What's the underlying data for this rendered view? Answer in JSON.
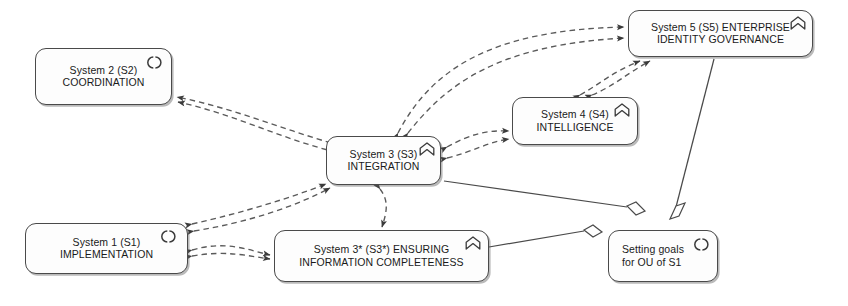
{
  "diagram": {
    "background_color": "#ffffff",
    "line_color": "#4a4a4a",
    "node_fill": "#fdfdfd"
  },
  "nodes": [
    {
      "id": "s2",
      "name": "system-2",
      "line1": "System 2 (S2)",
      "line2": "COORDINATION",
      "icon": "interaction-icon",
      "x": 35,
      "y": 48,
      "w": 137,
      "h": 57,
      "align": "center"
    },
    {
      "id": "s5",
      "name": "system-5",
      "line1": "System 5 (S5) ENTERPRISE",
      "line2": "IDENTITY GOVERNANCE",
      "icon": "function-icon",
      "x": 628,
      "y": 10,
      "w": 185,
      "h": 47,
      "align": "center"
    },
    {
      "id": "s4",
      "name": "system-4",
      "line1": "System 4 (S4)",
      "line2": "INTELLIGENCE",
      "icon": "function-icon",
      "x": 512,
      "y": 97,
      "w": 126,
      "h": 48,
      "align": "center"
    },
    {
      "id": "s3",
      "name": "system-3",
      "line1": "System 3 (S3)",
      "line2": "INTEGRATION",
      "icon": "function-icon",
      "x": 326,
      "y": 136,
      "w": 115,
      "h": 49,
      "align": "center"
    },
    {
      "id": "s1",
      "name": "system-1",
      "line1": "System 1 (S1)",
      "line2": "IMPLEMENTATION",
      "icon": "interaction-icon",
      "x": 25,
      "y": 223,
      "w": 163,
      "h": 51,
      "align": "center"
    },
    {
      "id": "s3star",
      "name": "system-3-star",
      "line1": "System 3* (S3*) ENSURING",
      "line2": "INFORMATION COMPLETENESS",
      "icon": "function-icon",
      "x": 274,
      "y": 230,
      "w": 215,
      "h": 52,
      "align": "center"
    },
    {
      "id": "goals",
      "name": "setting-goals",
      "line1": "Setting goals",
      "line2": "for OU of S1",
      "icon": "interaction-icon",
      "x": 608,
      "y": 230,
      "w": 110,
      "h": 52,
      "align": "left"
    }
  ],
  "connections": [
    {
      "name": "s3-to-s2-flow",
      "style": "dashed",
      "arrow": "both"
    },
    {
      "name": "s2-to-s3-flow",
      "style": "dashed",
      "arrow": "both"
    },
    {
      "name": "s3-to-s5-flow",
      "style": "dashed",
      "arrow": "both"
    },
    {
      "name": "s4-to-s5-flow",
      "style": "dashed",
      "arrow": "both"
    },
    {
      "name": "s3-to-s4-flow",
      "style": "dashed",
      "arrow": "both"
    },
    {
      "name": "s1-to-s3-flow",
      "style": "dashed",
      "arrow": "both"
    },
    {
      "name": "s1-to-s3star-flow",
      "style": "dashed",
      "arrow": "both"
    },
    {
      "name": "s3-to-s3star-flow",
      "style": "dashed",
      "arrow": "both"
    },
    {
      "name": "s3-to-goals-aggregation",
      "style": "solid",
      "marker": "diamond"
    },
    {
      "name": "s5-to-goals-aggregation",
      "style": "solid",
      "marker": "diamond"
    },
    {
      "name": "s3star-to-goals-aggregation",
      "style": "solid",
      "marker": "diamond"
    }
  ]
}
